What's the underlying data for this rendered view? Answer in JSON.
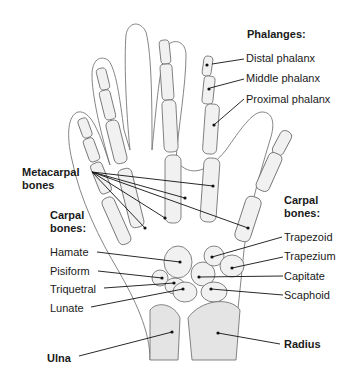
{
  "diagram": {
    "groups": {
      "phalanges": {
        "heading": "Phalanges:",
        "items": [
          "Distal phalanx",
          "Middle phalanx",
          "Proximal phalanx"
        ]
      },
      "metacarpals": {
        "heading_line1": "Metacarpal",
        "heading_line2": "bones"
      },
      "carpal_left": {
        "heading_line1": "Carpal",
        "heading_line2": "bones:",
        "items": [
          "Hamate",
          "Pisiform",
          "Triquetral",
          "Lunate"
        ]
      },
      "carpal_right": {
        "heading_line1": "Carpal",
        "heading_line2": "bones:",
        "items": [
          "Trapezoid",
          "Trapezium",
          "Capitate",
          "Scaphoid"
        ]
      },
      "forearm": {
        "ulna": "Ulna",
        "radius": "Radius"
      }
    },
    "colors": {
      "background": "#ffffff",
      "bone_fill": "#f1f1f1",
      "outline": "#666666",
      "text": "#1a1a1a"
    }
  }
}
